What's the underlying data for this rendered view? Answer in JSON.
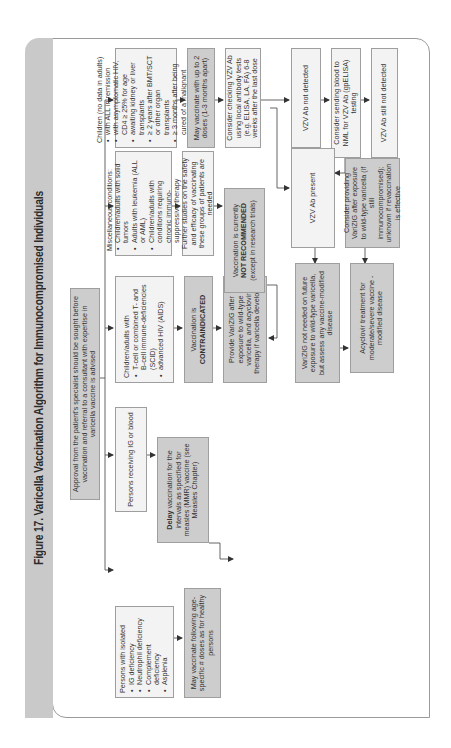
{
  "figure": {
    "title": "Figure 17. Varicella Vaccination Algorithm for Immunocompromised Individuals",
    "orientation": "rotated 90 degrees counter-clockwise"
  },
  "nodes": {
    "root": {
      "text": "Approval from the patient's specialist should be sought before vaccination and referral to a consultant with expertise in varicella vaccine is advised"
    },
    "col1": {
      "head": "Persons with isolated",
      "bullets": [
        "IG deficiency",
        "Neutrophil deficiency",
        "Complement deficiency",
        "Asplenia"
      ],
      "next": "May vaccinate following age-specific # doses as for healthy persons"
    },
    "col2": {
      "head": "Persons receiving IG or blood",
      "next_bold": "Delay",
      "next": "vaccination for the intervals as specified for measles (MMR) vaccine (see Measles Chapter)"
    },
    "col3": {
      "head": "Children/adults with",
      "bullets": [
        "T-cell or combined T- and B-cell immune-deficiencies (SCID)",
        "advanced HIV (AIDS)"
      ],
      "contra_prefix": "Vaccination is",
      "contra_bold": "CONTRAINDICATED",
      "varizig": "Provide VariZIG after exposure to wild-type varicella, and acyclovir therapy if varicella develops"
    },
    "col4": {
      "head": "Miscellaneous conditions:",
      "bullets": [
        "Children/adults with solid tumors",
        "Adults with leukemia (ALL or AML)",
        "Children/adults with conditions requiring chronic immuno-suppressive therapy"
      ],
      "studies": "Further studies on the safety and efficacy of vaccinating these groups of patients are needed",
      "notrec_prefix": "Vaccination is currently",
      "notrec_bold": "NOT RECOMMENDED",
      "notrec_suffix": "(except in research trials)"
    },
    "col5": {
      "head": "Children (no data in adults)",
      "bullets": [
        "with ALL in remission",
        "with asymptomatic HIV, CD4 ≥ 25% for age",
        "awaiting kidney or liver transplants",
        "≥ 2 years after BMT/SCT or other organ transplants",
        "≥ 3 months after being cured of a malignant disease"
      ],
      "may_vaccinate": "May vaccinate with up to 2 doses (1-3 months apart)",
      "consider_check": "Consider checking VZV Ab using local antibody tests (e.g. ELISA, LA, FA) 6-8 weeks after the last dose"
    },
    "results": {
      "not_detected": "VZV Ab not detected",
      "send_nml": "Consider sending blood to NML for VZV Ab (gpELISA) testing",
      "still_not_detected": "VZV Ab still not detected",
      "present": "VZV Ab present",
      "consider_varizig": "Consider providing VariZIG after exposure to wild-type varicella (if still immunocompromised); unknown if revaccination is effective",
      "varizig_not_needed": "VariZIG not needed on future exposure to wild-type varicella, but assess any vaccine-modified disease",
      "acyclovir": "Acyclovir treatment for moderate/severe vaccine - modified disease"
    }
  },
  "colors": {
    "light_box": "#f3f3f3",
    "dark_box": "#cdcdcd",
    "title_strip": "#c9c9c9",
    "line": "#555555"
  }
}
